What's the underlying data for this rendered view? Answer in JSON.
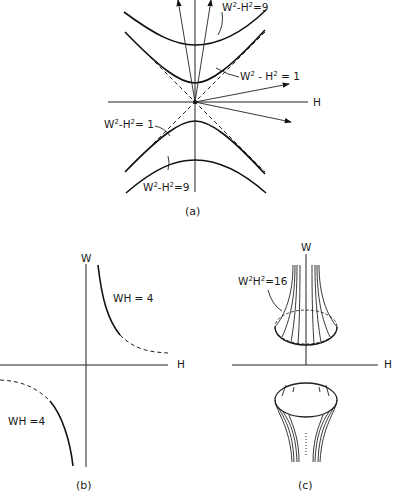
{
  "figure": {
    "panel_a": {
      "caption": "(a)",
      "axis_label_h": "H",
      "labels": {
        "upper_outer": {
          "base": "W",
          "sup1": "2",
          "mid": "-H",
          "sup2": "2",
          "rhs": "=9"
        },
        "upper_inner": {
          "base": "W",
          "sup1": "2",
          "mid": " - H",
          "sup2": "2",
          "rhs": " = 1"
        },
        "lower_inner": {
          "base": "W",
          "sup1": "2",
          "mid": "-H",
          "sup2": "2",
          "rhs": "= 1"
        },
        "lower_outer": {
          "base": "W",
          "sup1": "2",
          "mid": "-H",
          "sup2": "2",
          "rhs": "=9"
        }
      }
    },
    "panel_b": {
      "caption": "(b)",
      "axis_label_w": "W",
      "axis_label_h": "H",
      "label_upper": "WH = 4",
      "label_lower": "WH =4"
    },
    "panel_c": {
      "caption": "(c)",
      "axis_label_w": "W",
      "axis_label_h": "H",
      "label": {
        "base": "W",
        "sup1": "2",
        "mid": "H",
        "sup2": "2",
        "rhs": "=16"
      }
    }
  }
}
